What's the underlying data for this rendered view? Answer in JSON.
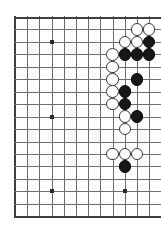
{
  "diagram": {
    "kind": "go-board-diagram",
    "board_size": 19,
    "visible_columns": 12,
    "visible_rows": 17,
    "orientation": "right-side-partial",
    "colors": {
      "background": "#ffffff",
      "grid_line": "#6e6e6e",
      "edge_line": "#3d3d3d",
      "black_stone": "#171717",
      "white_stone": "#ffffff",
      "stone_outline": "#3a3a3a",
      "star_point": "#2b2b2b"
    },
    "geometry": {
      "origin_x": 15,
      "origin_y": 17,
      "spacing_x": 12.2,
      "spacing_y": 12.45,
      "stone_diameter": 12.6
    },
    "star_points": [
      {
        "col": 3,
        "row": 2,
        "name": "star-point-upper-left"
      },
      {
        "col": 3,
        "row": 8,
        "name": "star-point-center-left"
      },
      {
        "col": 9,
        "row": 8,
        "name": "star-point-center-right"
      },
      {
        "col": 3,
        "row": 14,
        "name": "star-point-lower-left"
      },
      {
        "col": 9,
        "row": 14,
        "name": "star-point-lower-right"
      }
    ],
    "stones": [
      {
        "col": 10,
        "row": 1,
        "color": "white",
        "label": "white-stone-k2"
      },
      {
        "col": 11,
        "row": 1,
        "color": "white",
        "label": "white-stone-l2"
      },
      {
        "col": 9,
        "row": 2,
        "color": "white",
        "label": "white-stone-j3"
      },
      {
        "col": 10,
        "row": 2,
        "color": "white",
        "label": "white-stone-k3"
      },
      {
        "col": 11,
        "row": 2,
        "color": "black",
        "label": "black-stone-l3"
      },
      {
        "col": 8,
        "row": 3,
        "color": "white",
        "label": "white-stone-h4"
      },
      {
        "col": 9,
        "row": 3,
        "color": "black",
        "label": "black-stone-j4"
      },
      {
        "col": 10,
        "row": 3,
        "color": "black",
        "label": "black-stone-k4"
      },
      {
        "col": 11,
        "row": 3,
        "color": "black",
        "label": "black-stone-l4"
      },
      {
        "col": 8,
        "row": 4,
        "color": "white",
        "label": "white-stone-h5"
      },
      {
        "col": 8,
        "row": 5,
        "color": "white",
        "label": "white-stone-h6"
      },
      {
        "col": 10,
        "row": 5,
        "color": "black",
        "label": "black-stone-k6"
      },
      {
        "col": 8,
        "row": 6,
        "color": "white",
        "label": "white-stone-h7"
      },
      {
        "col": 9,
        "row": 6,
        "color": "black",
        "label": "black-stone-j7"
      },
      {
        "col": 8,
        "row": 7,
        "color": "white",
        "label": "white-stone-h8"
      },
      {
        "col": 9,
        "row": 7,
        "color": "black",
        "label": "black-stone-j8"
      },
      {
        "col": 9,
        "row": 8,
        "color": "white",
        "label": "white-stone-j9"
      },
      {
        "col": 10,
        "row": 8,
        "color": "black",
        "label": "black-stone-k9"
      },
      {
        "col": 9,
        "row": 9,
        "color": "white",
        "label": "white-stone-j10"
      },
      {
        "col": 8,
        "row": 11,
        "color": "white",
        "label": "white-stone-h12"
      },
      {
        "col": 9,
        "row": 11,
        "color": "white",
        "label": "white-stone-j12"
      },
      {
        "col": 10,
        "row": 11,
        "color": "white",
        "label": "white-stone-k12"
      },
      {
        "col": 9,
        "row": 12,
        "color": "black",
        "label": "black-stone-j13"
      }
    ],
    "counts": {
      "black_stones": 9,
      "white_stones": 14,
      "total_stones": 23
    }
  }
}
